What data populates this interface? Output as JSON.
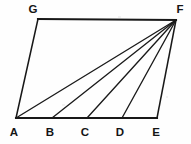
{
  "figure": {
    "background_color": "#fefefe",
    "line_color": "#181818",
    "label_color": "#151515",
    "vertices": [
      {
        "name": "G",
        "label": "G",
        "x": 38,
        "y": 19,
        "label_x": 33,
        "label_y": 13
      },
      {
        "name": "F",
        "label": "F",
        "x": 176,
        "y": 20,
        "label_x": 180,
        "label_y": 13
      },
      {
        "name": "A",
        "label": "A",
        "x": 16,
        "y": 118,
        "label_x": 14,
        "label_y": 136
      },
      {
        "name": "B",
        "label": "B",
        "x": 52,
        "y": 118,
        "label_x": 50,
        "label_y": 136
      },
      {
        "name": "C",
        "label": "C",
        "x": 87,
        "y": 118,
        "label_x": 85,
        "label_y": 136
      },
      {
        "name": "D",
        "label": "D",
        "x": 122,
        "y": 118,
        "label_x": 120,
        "label_y": 136
      },
      {
        "name": "E",
        "label": "E",
        "x": 157,
        "y": 118,
        "label_x": 156,
        "label_y": 136
      }
    ],
    "edges": [
      {
        "name": "edge-GF",
        "from": "G",
        "to": "F",
        "style": "top",
        "d": "M 38 19 L 176 20"
      },
      {
        "name": "edge-AG",
        "from": "A",
        "to": "G",
        "style": "side",
        "d": "M 16 118 L 38 19"
      },
      {
        "name": "edge-FE",
        "from": "F",
        "to": "E",
        "style": "side",
        "d": "M 176 20 L 157 118"
      },
      {
        "name": "edge-AE",
        "from": "A",
        "to": "E",
        "style": "base",
        "d": "M 16 118 L 157 118"
      }
    ],
    "cevians": [
      {
        "name": "cevian-FA",
        "from": "F",
        "to": "A",
        "d": "M 176 20 L 16 118"
      },
      {
        "name": "cevian-FB",
        "from": "F",
        "to": "B",
        "d": "M 176 20 L 52 118"
      },
      {
        "name": "cevian-FC",
        "from": "F",
        "to": "C",
        "d": "M 176 20 L 87 118"
      },
      {
        "name": "cevian-FD",
        "from": "F",
        "to": "D",
        "d": "M 176 20 L 122 118"
      }
    ],
    "base_segments": [
      "AB",
      "BC",
      "CD",
      "DE"
    ]
  }
}
